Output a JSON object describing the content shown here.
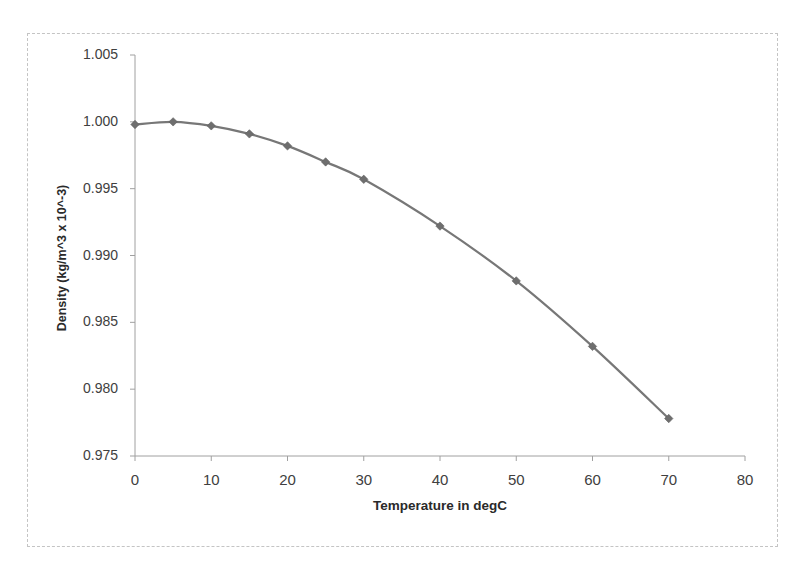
{
  "chart_data": {
    "type": "line",
    "title": "",
    "xlabel": "Temperature in degC",
    "ylabel": "Density (kg/m^3 x 10^-3)",
    "xlim": [
      0,
      80
    ],
    "ylim": [
      0.975,
      1.005
    ],
    "x_ticks": [
      "0",
      "10",
      "20",
      "30",
      "40",
      "50",
      "60",
      "70",
      "80"
    ],
    "y_ticks": [
      "1.005",
      "1.000",
      "0.995",
      "0.990",
      "0.985",
      "0.980",
      "0.975"
    ],
    "grid": false,
    "legend": null,
    "series": [
      {
        "name": "Density",
        "marker": "diamond",
        "color": "#777777",
        "x": [
          0,
          5,
          10,
          15,
          20,
          25,
          30,
          40,
          50,
          60,
          70
        ],
        "y": [
          0.9998,
          1.0,
          0.9997,
          0.9991,
          0.9982,
          0.997,
          0.9957,
          0.9922,
          0.9881,
          0.9832,
          0.9778
        ]
      }
    ]
  },
  "axes": {
    "x_title": "Temperature in degC",
    "y_title": "Density (kg/m^3 x 10^-3)"
  },
  "colors": {
    "line": "#777777",
    "marker": "#6e6e6e",
    "axis": "#a0a0a0",
    "frame": "#c4c4c4"
  }
}
